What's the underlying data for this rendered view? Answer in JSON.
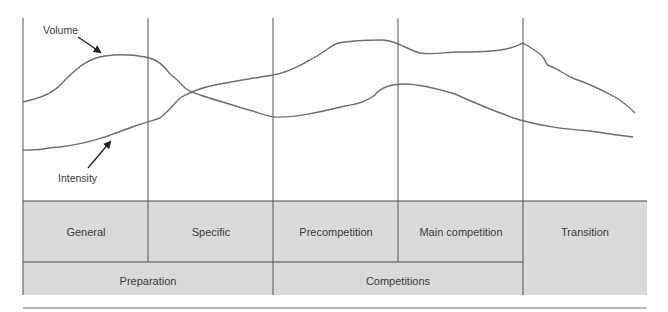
{
  "diagram": {
    "type": "periodization-chart",
    "colors": {
      "grid_line": "#555555",
      "curve": "#6e6e6e",
      "box_fill": "#d9d9d9",
      "box_border": "#4a4a4a",
      "arrow": "#222222",
      "text": "#3a3a3a"
    },
    "curves": [
      {
        "name": "Volume",
        "label": "Volume",
        "description": "Rises through general preparation, declines through specific phase, rises again through precompetition to a peak at end of main competition, then falls in transition"
      },
      {
        "name": "Intensity",
        "label": "Intensity",
        "description": "Low in general phase, rises steadily through specific phase crossing volume, dips slightly at start of precompetition, peaks early in main competition, then declines into transition"
      }
    ],
    "phases_row1": [
      {
        "label": "General"
      },
      {
        "label": "Specific"
      },
      {
        "label": "Precompetition"
      },
      {
        "label": "Main competition"
      },
      {
        "label": "Transition"
      }
    ],
    "phases_row2": [
      {
        "label": "Preparation"
      },
      {
        "label": "Competitions"
      }
    ]
  }
}
